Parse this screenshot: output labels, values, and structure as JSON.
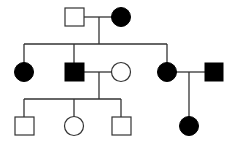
{
  "diagram": {
    "type": "pedigree",
    "legend": {
      "square": "male",
      "circle": "female",
      "filled": "affected",
      "open": "unaffected"
    },
    "colors": {
      "affected": "#000000",
      "unaffected": "#ffffff",
      "line": "#333333"
    },
    "individuals": [
      {
        "id": "I-1",
        "generation": 1,
        "sex": "male",
        "affected": false
      },
      {
        "id": "I-2",
        "generation": 1,
        "sex": "female",
        "affected": true
      },
      {
        "id": "II-1",
        "generation": 2,
        "sex": "female",
        "affected": true
      },
      {
        "id": "II-2",
        "generation": 2,
        "sex": "male",
        "affected": true
      },
      {
        "id": "II-3",
        "generation": 2,
        "sex": "female",
        "affected": false
      },
      {
        "id": "II-4",
        "generation": 2,
        "sex": "female",
        "affected": true
      },
      {
        "id": "II-5",
        "generation": 2,
        "sex": "male",
        "affected": true
      },
      {
        "id": "III-1",
        "generation": 3,
        "sex": "male",
        "affected": false
      },
      {
        "id": "III-2",
        "generation": 3,
        "sex": "female",
        "affected": false
      },
      {
        "id": "III-3",
        "generation": 3,
        "sex": "male",
        "affected": false
      },
      {
        "id": "III-4",
        "generation": 3,
        "sex": "female",
        "affected": true
      }
    ],
    "matings": [
      {
        "partners": [
          "I-1",
          "I-2"
        ],
        "children": [
          "II-1",
          "II-2",
          "II-4"
        ]
      },
      {
        "partners": [
          "II-2",
          "II-3"
        ],
        "children": [
          "III-1",
          "III-2",
          "III-3"
        ]
      },
      {
        "partners": [
          "II-4",
          "II-5"
        ],
        "children": [
          "III-4"
        ]
      }
    ]
  }
}
